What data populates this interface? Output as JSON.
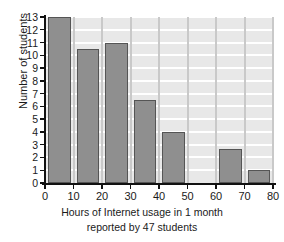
{
  "chart_data": {
    "type": "bar",
    "title": "",
    "subtitle": "",
    "xlabel_line1": "Hours of Internet usage in 1 month",
    "xlabel_line2": "reported by 47 students",
    "ylabel": "Number of students",
    "xlim": [
      0,
      80
    ],
    "ylim": [
      0,
      13
    ],
    "grid": true,
    "legend": "none",
    "bin_width": 10,
    "categories": [
      "0-10",
      "10-20",
      "20-30",
      "30-40",
      "40-50",
      "50-60",
      "60-70",
      "70-80"
    ],
    "bin_starts": [
      0,
      10,
      20,
      30,
      40,
      50,
      60,
      70
    ],
    "values": [
      13,
      10.5,
      11,
      6.5,
      4,
      0,
      2.7,
      1
    ],
    "xticks": [
      "0",
      "10",
      "20",
      "30",
      "40",
      "50",
      "60",
      "70",
      "80"
    ],
    "xtick_values": [
      0,
      10,
      20,
      30,
      40,
      50,
      60,
      70,
      80
    ],
    "yticks": [
      "0",
      "1",
      "2",
      "3",
      "4",
      "5",
      "6",
      "7",
      "8",
      "9",
      "10",
      "11",
      "12",
      "13"
    ],
    "ytick_values": [
      0,
      1,
      2,
      3,
      4,
      5,
      6,
      7,
      8,
      9,
      10,
      11,
      12,
      13
    ],
    "bars": [
      {
        "label": "0-10",
        "start": 0,
        "end": 10,
        "value": 13
      },
      {
        "label": "10-20",
        "start": 10,
        "end": 20,
        "value": 10.5
      },
      {
        "label": "20-30",
        "start": 20,
        "end": 30,
        "value": 11
      },
      {
        "label": "30-40",
        "start": 30,
        "end": 40,
        "value": 6.5
      },
      {
        "label": "40-50",
        "start": 40,
        "end": 50,
        "value": 4
      },
      {
        "label": "50-60",
        "start": 50,
        "end": 60,
        "value": 0
      },
      {
        "label": "60-70",
        "start": 60,
        "end": 70,
        "value": 2.7
      },
      {
        "label": "70-80",
        "start": 70,
        "end": 80,
        "value": 1
      }
    ],
    "colors": {
      "bar_fill": "#8f8f8f",
      "bar_edge": "#555555",
      "plot_background": "#e8e8e8",
      "hgrid": "#ffffff",
      "vgrid": "#c9c9c9",
      "axis": "#111111",
      "text": "#1a1a1a",
      "figure_background": "#ffffff"
    }
  }
}
